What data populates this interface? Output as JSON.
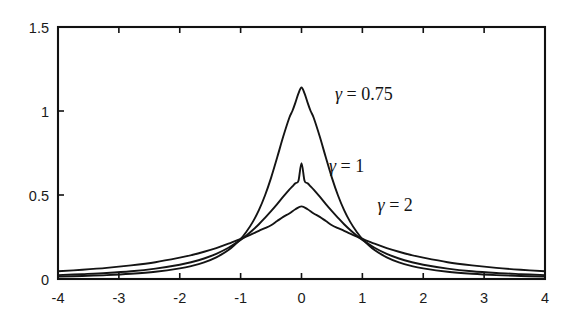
{
  "chart_data": {
    "type": "line",
    "title": "",
    "subtitle": "",
    "xlabel": "",
    "ylabel": "",
    "xlim": [
      -4,
      4
    ],
    "ylim": [
      0,
      1.5
    ],
    "grid": false,
    "legend_position": "inline-annotations",
    "x_ticks": [
      -4,
      -3,
      -2,
      -1,
      0,
      1,
      2,
      3,
      4
    ],
    "x_tick_labels": [
      "-4",
      "-3",
      "-2",
      "-1",
      "0",
      "1",
      "2",
      "3",
      "4"
    ],
    "y_ticks": [
      0,
      0.5,
      1,
      1.5
    ],
    "y_tick_labels": [
      "0",
      "0.5",
      "1",
      "1.5"
    ],
    "series": [
      {
        "name": "gamma = 0.75",
        "label": "γ = 0.75",
        "gamma": 0.75,
        "peak_value": 1.14,
        "peak_x": 0,
        "label_x": 0.55,
        "label_y": 1.1,
        "x": [
          -4,
          -3.6,
          -3.2,
          -2.8,
          -2.4,
          -2,
          -1.8,
          -1.6,
          -1.4,
          -1.2,
          -1,
          -0.9,
          -0.8,
          -0.7,
          -0.6,
          -0.5,
          -0.4,
          -0.3,
          -0.2,
          -0.15,
          -0.1,
          -0.05,
          0,
          0.05,
          0.1,
          0.15,
          0.2,
          0.3,
          0.4,
          0.5,
          0.6,
          0.7,
          0.8,
          0.9,
          1,
          1.2,
          1.4,
          1.6,
          1.8,
          2,
          2.4,
          2.8,
          3.2,
          3.6,
          4
        ],
        "y": [
          0.014,
          0.018,
          0.023,
          0.031,
          0.043,
          0.063,
          0.078,
          0.099,
          0.129,
          0.172,
          0.238,
          0.284,
          0.34,
          0.41,
          0.497,
          0.602,
          0.723,
          0.848,
          0.96,
          1.0,
          1.05,
          1.105,
          1.14,
          1.105,
          1.05,
          1.0,
          0.96,
          0.848,
          0.723,
          0.602,
          0.497,
          0.41,
          0.34,
          0.284,
          0.238,
          0.172,
          0.129,
          0.099,
          0.078,
          0.063,
          0.043,
          0.031,
          0.023,
          0.018,
          0.014
        ]
      },
      {
        "name": "gamma = 1",
        "label": "γ = 1",
        "gamma": 1,
        "peak_value": 0.69,
        "peak_x": 0,
        "label_x": 0.45,
        "label_y": 0.67,
        "x": [
          -4,
          -3.6,
          -3.2,
          -2.8,
          -2.4,
          -2,
          -1.8,
          -1.6,
          -1.4,
          -1.2,
          -1,
          -0.9,
          -0.8,
          -0.7,
          -0.6,
          -0.5,
          -0.4,
          -0.3,
          -0.2,
          -0.15,
          -0.1,
          -0.05,
          0,
          0.05,
          0.1,
          0.15,
          0.2,
          0.3,
          0.4,
          0.5,
          0.6,
          0.7,
          0.8,
          0.9,
          1,
          1.2,
          1.4,
          1.6,
          1.8,
          2,
          2.4,
          2.8,
          3.2,
          3.6,
          4
        ],
        "y": [
          0.023,
          0.029,
          0.036,
          0.046,
          0.062,
          0.085,
          0.101,
          0.122,
          0.15,
          0.186,
          0.233,
          0.261,
          0.292,
          0.326,
          0.364,
          0.404,
          0.446,
          0.49,
          0.532,
          0.551,
          0.57,
          0.585,
          0.69,
          0.585,
          0.57,
          0.551,
          0.532,
          0.49,
          0.446,
          0.404,
          0.364,
          0.326,
          0.292,
          0.261,
          0.233,
          0.186,
          0.15,
          0.122,
          0.101,
          0.085,
          0.062,
          0.046,
          0.036,
          0.029,
          0.023
        ]
      },
      {
        "name": "gamma = 2",
        "label": "γ = 2",
        "gamma": 2,
        "peak_value": 0.43,
        "peak_x": 0,
        "label_x": 1.25,
        "label_y": 0.44,
        "x": [
          -4,
          -3.6,
          -3.2,
          -2.8,
          -2.4,
          -2,
          -1.8,
          -1.6,
          -1.4,
          -1.2,
          -1,
          -0.9,
          -0.8,
          -0.7,
          -0.6,
          -0.5,
          -0.4,
          -0.3,
          -0.2,
          -0.1,
          0,
          0.1,
          0.2,
          0.3,
          0.4,
          0.5,
          0.6,
          0.7,
          0.8,
          0.9,
          1,
          1.2,
          1.4,
          1.6,
          1.8,
          2,
          2.4,
          2.8,
          3.2,
          3.6,
          4
        ],
        "y": [
          0.046,
          0.055,
          0.066,
          0.081,
          0.1,
          0.127,
          0.143,
          0.162,
          0.184,
          0.21,
          0.239,
          0.254,
          0.27,
          0.287,
          0.303,
          0.32,
          0.345,
          0.37,
          0.39,
          0.415,
          0.432,
          0.415,
          0.39,
          0.37,
          0.345,
          0.32,
          0.303,
          0.287,
          0.27,
          0.254,
          0.239,
          0.21,
          0.184,
          0.162,
          0.143,
          0.127,
          0.1,
          0.081,
          0.066,
          0.055,
          0.046
        ]
      }
    ],
    "colors": {
      "curve": "#141414",
      "axis": "#111111",
      "text": "#1a1a1a",
      "background": "#ffffff"
    }
  }
}
